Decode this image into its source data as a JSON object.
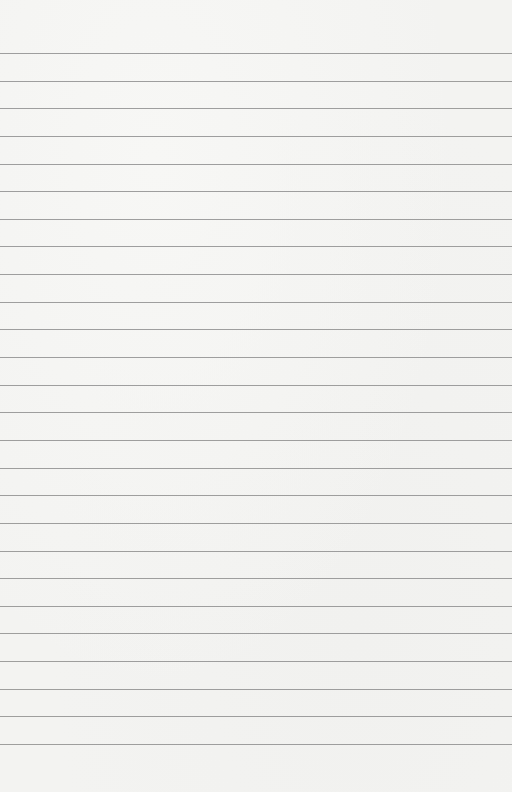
{
  "page": {
    "type": "lined-paper",
    "background_color": "#f3f3f1",
    "rule_color": "#8e8e8e",
    "rule_count": 26,
    "first_rule_y": 53,
    "rule_spacing": 27.64
  },
  "text_lines": []
}
